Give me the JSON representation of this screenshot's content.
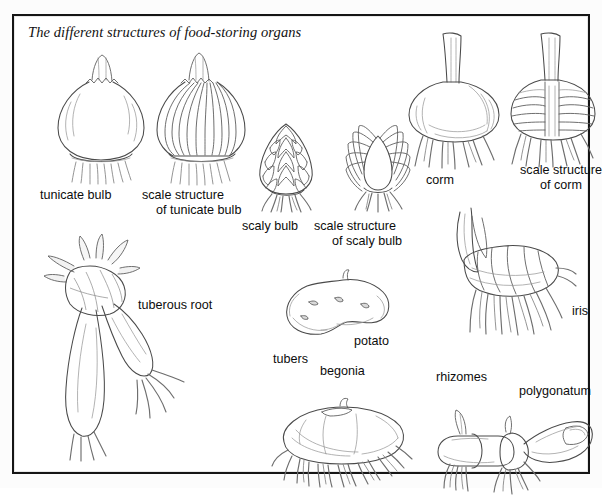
{
  "plate": {
    "title": "The different structures of food-storing organs",
    "border_color": "#151515",
    "background_color": "#ffffff",
    "pencil_color": "#5f5f5f"
  },
  "figures": [
    {
      "id": "tunicate-bulb",
      "label": "tunicate bulb"
    },
    {
      "id": "scale-structure-tunicate",
      "label": "scale structure\nof tunicate bulb",
      "line1": "scale structure",
      "line2": "of tunicate bulb"
    },
    {
      "id": "scaly-bulb",
      "label": "scaly bulb"
    },
    {
      "id": "scale-structure-scaly",
      "label": "scale structure\nof scaly bulb",
      "line1": "scale structure",
      "line2": "of scaly bulb"
    },
    {
      "id": "corm",
      "label": "corm"
    },
    {
      "id": "scale-structure-corm",
      "label": "scale structure\nof corm",
      "line1": "scale structure",
      "line2": "of corm"
    },
    {
      "id": "tuberous-root",
      "label": "tuberous root"
    },
    {
      "id": "potato",
      "label": "potato"
    },
    {
      "id": "tubers",
      "label": "tubers"
    },
    {
      "id": "begonia",
      "label": "begonia"
    },
    {
      "id": "iris",
      "label": "iris"
    },
    {
      "id": "rhizomes",
      "label": "rhizomes"
    },
    {
      "id": "polygonatum",
      "label": "polygonatum"
    }
  ],
  "labels": {
    "tunicate_bulb": "tunicate bulb",
    "scale_structure_tunicate_l1": "scale structure",
    "scale_structure_tunicate_l2": "of tunicate bulb",
    "scaly_bulb": "scaly bulb",
    "scale_structure_scaly_l1": "scale structure",
    "scale_structure_scaly_l2": "of scaly bulb",
    "corm": "corm",
    "scale_structure_corm_l1": "scale structure",
    "scale_structure_corm_l2": "of corm",
    "tuberous_root": "tuberous root",
    "potato": "potato",
    "tubers": "tubers",
    "begonia": "begonia",
    "iris": "iris",
    "rhizomes": "rhizomes",
    "polygonatum": "polygonatum"
  }
}
